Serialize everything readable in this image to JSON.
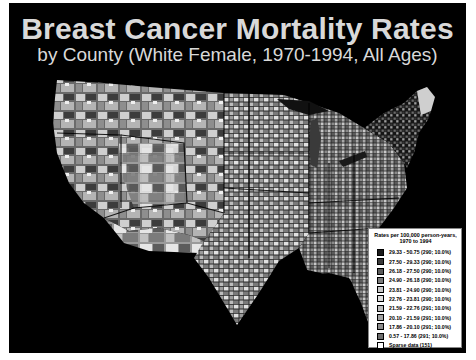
{
  "title": "Breast Cancer Mortality Rates",
  "subtitle": "by County (White Female, 1970-1994, All Ages)",
  "map": {
    "region": "Contiguous United States, county level",
    "style": "grayscale choropleth on black background",
    "background": "#000000"
  },
  "legend": {
    "title_line1": "Rates per 100,000 person-years,",
    "title_line2": "1970 to 1994",
    "items": [
      {
        "label": "29.33 - 50.75 (290; 10.0%)",
        "color": "#1a1a1a"
      },
      {
        "label": "27.50 - 29.33 (290; 10.0%)",
        "color": "#3a3a3a"
      },
      {
        "label": "26.18 - 27.50 (290; 10.0%)",
        "color": "#5a5a5a"
      },
      {
        "label": "24.90 - 26.18 (290; 10.0%)",
        "color": "#7a7a7a"
      },
      {
        "label": "23.81 - 24.90 (290; 10.0%)",
        "color": "#c8c8c8"
      },
      {
        "label": "22.76 - 23.81 (290; 10.0%)",
        "color": "#dedede"
      },
      {
        "label": "21.59 - 22.76 (291; 10.0%)",
        "color": "#bdbdbd"
      },
      {
        "label": "20.10 - 21.59 (291; 10.0%)",
        "color": "#a3a3a3"
      },
      {
        "label": "17.86 - 20.10 (291; 10.0%)",
        "color": "#8c8c8c"
      },
      {
        "label": "0.57 - 17.86 (291; 10.0%)",
        "color": "#6e6e6e"
      },
      {
        "label": "Sparse data (151)",
        "color": "#ffffff"
      }
    ]
  }
}
